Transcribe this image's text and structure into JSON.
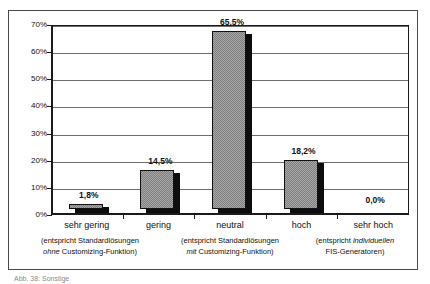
{
  "top_fragment": {
    "text": "—"
  },
  "caption": {
    "text": "Abb. 38:  Sonstige"
  },
  "chart_data": {
    "type": "bar",
    "title": "",
    "subtitle": "",
    "xlabel": "",
    "ylabel": "",
    "categories": [
      "sehr gering",
      "gering",
      "neutral",
      "hoch",
      "sehr hoch"
    ],
    "values": [
      1.8,
      14.5,
      65.5,
      18.2,
      0.0
    ],
    "value_labels": [
      "1,8%",
      "14,5%",
      "65,5%",
      "18,2%",
      "0,0%"
    ],
    "ylim": [
      0,
      70
    ],
    "ytick_values": [
      0,
      10,
      20,
      30,
      40,
      50,
      60,
      70
    ],
    "ytick_labels": [
      "0%",
      "10%",
      "20%",
      "30%",
      "40%",
      "50%",
      "60%",
      "70%"
    ],
    "grid": true,
    "legend": false,
    "bar_fill_color": "#a8a8a8",
    "bar_shadow_color": "#0d0d0d",
    "bar_border_color": "#111111",
    "axis_color": "#1a1a1a",
    "gridline_color": "#6e6e6e",
    "background_color": "#ffffff",
    "annotations": [
      {
        "id": "group-left",
        "line1_plain": "(entspricht Standardlösungen",
        "line2_italic": "ohne",
        "line2_plain": " Customizing-Funktion)"
      },
      {
        "id": "group-middle",
        "line1_plain": "(entspricht Standardlösungen",
        "line2_italic": "mit",
        "line2_plain": " Customizing-Funktion)"
      },
      {
        "id": "group-right",
        "line1_plain": "(entspricht ",
        "line1_italic": "individuellen",
        "line2_plain": "FIS-Generatoren)"
      }
    ]
  }
}
